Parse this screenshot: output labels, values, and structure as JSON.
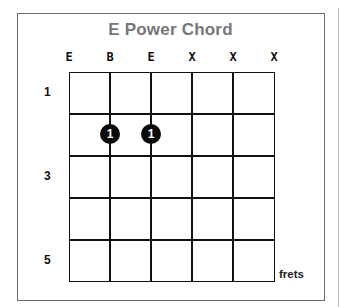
{
  "title": "E Power Chord",
  "strings": [
    "E",
    "B",
    "E",
    "X",
    "X",
    "X"
  ],
  "fret_labels": [
    {
      "label": "1",
      "row": 1
    },
    {
      "label": "3",
      "row": 3
    },
    {
      "label": "5",
      "row": 5
    }
  ],
  "dots": [
    {
      "string": 1,
      "fret": 2,
      "finger": "1"
    },
    {
      "string": 2,
      "fret": 2,
      "finger": "1"
    }
  ],
  "footer_label": "frets",
  "colors": {
    "title": "#777777",
    "grid": "#111111",
    "dot": "#0a0a0a",
    "border": "#6e6e6e"
  }
}
